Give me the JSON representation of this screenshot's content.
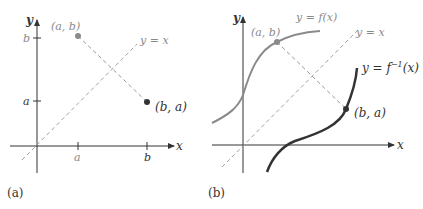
{
  "panel_a": {
    "caption": "(a)",
    "x_axis_label": "x",
    "y_axis_label": "y",
    "x_ticks": [
      "a",
      "b"
    ],
    "y_ticks": [
      "b",
      "a"
    ],
    "point_ab_label": "(a, b)",
    "point_ba_label": "(b, a)",
    "diagonal_label": "y = x"
  },
  "panel_b": {
    "caption": "(b)",
    "x_axis_label": "x",
    "y_axis_label": "y",
    "f_label": "y = f(x)",
    "finv_label_base": "y = f",
    "finv_label_sup": "−1",
    "finv_label_tail": "(x)",
    "diagonal_label": "y = x",
    "point_ab_label": "(a, b)",
    "point_ba_label": "(b, a)"
  },
  "colors": {
    "axis": "#333333",
    "gray": "#8a8a8a",
    "dark": "#333333",
    "dashed": "#a0a0a0"
  }
}
